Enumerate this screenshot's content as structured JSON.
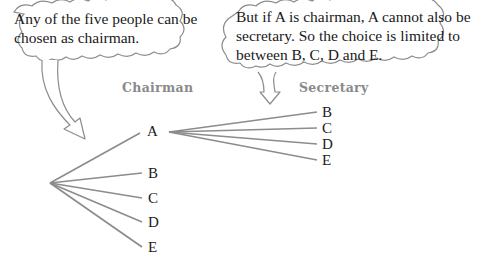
{
  "bubbles": [
    {
      "id": "left",
      "text_lines": [
        "Any of the five people can be",
        "chosen as chairman."
      ]
    },
    {
      "id": "right",
      "text_lines": [
        "But if A is chairman, A cannot also be",
        "secretary. So the choice is limited to",
        "between B, C, D and E."
      ]
    }
  ],
  "headers": {
    "chairman": "Chairman",
    "secretary": "Secretary"
  },
  "tree": {
    "chairman_options": [
      "A",
      "B",
      "C",
      "D",
      "E"
    ],
    "secretary_options_given_A": [
      "B",
      "C",
      "D",
      "E"
    ]
  },
  "colors": {
    "line": "#8c8c8c",
    "header": "#8a8a8a",
    "text": "#1a1a1a"
  }
}
